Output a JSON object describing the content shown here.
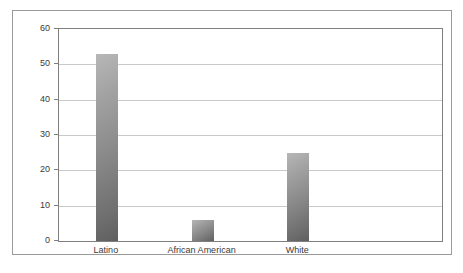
{
  "chart_data": {
    "type": "bar",
    "title": "",
    "subtitle": "",
    "xlabel": "",
    "ylabel": "",
    "categories": [
      "Latino",
      "African American",
      "White"
    ],
    "values": [
      53,
      6,
      25
    ],
    "ylim": [
      0,
      60
    ],
    "yticks": [
      0,
      10,
      20,
      30,
      40,
      50,
      60
    ],
    "ytick_labels": [
      "0",
      "10",
      "20",
      "30",
      "40",
      "50",
      "60"
    ],
    "grid": true,
    "legend": null,
    "legend_position": "none",
    "annotations": [],
    "colors": {
      "bar_light": "#b7b7b7",
      "bar_dark": "#5f5f5f",
      "gridline": "#c9c9c9",
      "axis": "#7f7f7f",
      "frame": "#9a9a9a",
      "text": "#3a3a3a",
      "background": "#ffffff"
    }
  }
}
